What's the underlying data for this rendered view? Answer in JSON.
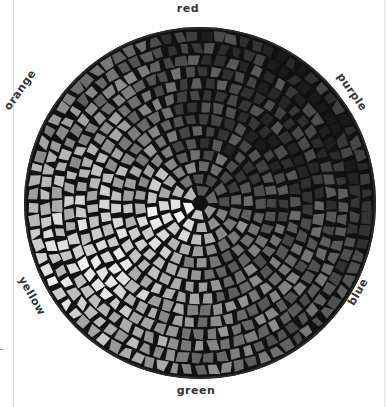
{
  "figure": {
    "type": "photograph",
    "labels": {
      "top": "red",
      "upper_right": "purple",
      "lower_right": "blue",
      "bottom": "green",
      "lower_left": "yellow",
      "upper_left": "orange"
    },
    "sectors": [
      {
        "name": "red",
        "shade": "#3c3c3c"
      },
      {
        "name": "purple",
        "shade": "#2e2e2e"
      },
      {
        "name": "blue",
        "shade": "#555555"
      },
      {
        "name": "green",
        "shade": "#7a7a7a"
      },
      {
        "name": "yellow",
        "shade": "#e4e4e4"
      },
      {
        "name": "orange",
        "shade": "#8c8c8c"
      }
    ],
    "colors": {
      "background": "#ffffff",
      "grout": "#111111",
      "label_text": "#333333"
    }
  }
}
